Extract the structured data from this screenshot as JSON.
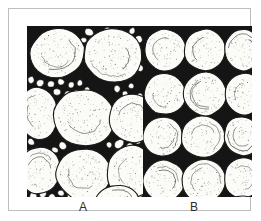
{
  "figure": {
    "frame_color": "#bdbdbd",
    "background_color": "#ffffff",
    "matrix_color": "#151515",
    "grain_fill_color": "#fbfbf7",
    "grain_outline_color": "#1a1a1a",
    "stipple_color": "#3c3c3c"
  },
  "panels": [
    {
      "id": "a",
      "label": "A",
      "sorting": "poorly sorted",
      "grain_count_large": 9,
      "grain_count_fine": 46,
      "pore_filling": "fine matrix grains",
      "large_grains": [
        {
          "cx": 30,
          "cy": 27,
          "rx": 27,
          "ry": 25,
          "rot": -12
        },
        {
          "cx": 86,
          "cy": 30,
          "rx": 30,
          "ry": 27,
          "rot": 8
        },
        {
          "cx": 11,
          "cy": 88,
          "rx": 20,
          "ry": 27,
          "rot": -6
        },
        {
          "cx": 57,
          "cy": 92,
          "rx": 31,
          "ry": 29,
          "rot": 14
        },
        {
          "cx": 106,
          "cy": 92,
          "rx": 24,
          "ry": 25,
          "rot": -9
        },
        {
          "cx": 12,
          "cy": 144,
          "rx": 21,
          "ry": 24,
          "rot": 10
        },
        {
          "cx": 57,
          "cy": 148,
          "rx": 28,
          "ry": 26,
          "rot": -5
        },
        {
          "cx": 104,
          "cy": 146,
          "rx": 24,
          "ry": 27,
          "rot": 6
        },
        {
          "cx": 90,
          "cy": 175,
          "rx": 22,
          "ry": 16,
          "rot": -3
        }
      ],
      "fine_grains": [
        {
          "cx": 62,
          "cy": 6,
          "rx": 4.5,
          "ry": 4.0
        },
        {
          "cx": 72,
          "cy": 9,
          "rx": 3.6,
          "ry": 3.2
        },
        {
          "cx": 80,
          "cy": 4,
          "rx": 3.2,
          "ry": 2.8
        },
        {
          "cx": 105,
          "cy": 5,
          "rx": 3.4,
          "ry": 3.0
        },
        {
          "cx": 112,
          "cy": 13,
          "rx": 3.8,
          "ry": 3.4
        },
        {
          "cx": 57,
          "cy": 14,
          "rx": 3.0,
          "ry": 2.6
        },
        {
          "cx": 109,
          "cy": 30,
          "rx": 3.4,
          "ry": 3.6
        },
        {
          "cx": 113,
          "cy": 42,
          "rx": 3.6,
          "ry": 3.4
        },
        {
          "cx": 4,
          "cy": 54,
          "rx": 3.6,
          "ry": 3.4
        },
        {
          "cx": 13,
          "cy": 57,
          "rx": 4.0,
          "ry": 3.6
        },
        {
          "cx": 24,
          "cy": 58,
          "rx": 3.8,
          "ry": 3.4
        },
        {
          "cx": 34,
          "cy": 56,
          "rx": 3.6,
          "ry": 3.2
        },
        {
          "cx": 44,
          "cy": 59,
          "rx": 3.4,
          "ry": 3.0
        },
        {
          "cx": 53,
          "cy": 57,
          "rx": 3.2,
          "ry": 3.0
        },
        {
          "cx": 30,
          "cy": 66,
          "rx": 4.0,
          "ry": 3.6
        },
        {
          "cx": 41,
          "cy": 68,
          "rx": 3.6,
          "ry": 3.2
        },
        {
          "cx": 50,
          "cy": 67,
          "rx": 3.4,
          "ry": 3.0
        },
        {
          "cx": 60,
          "cy": 64,
          "rx": 3.2,
          "ry": 2.8
        },
        {
          "cx": 6,
          "cy": 66,
          "rx": 3.4,
          "ry": 3.2
        },
        {
          "cx": 16,
          "cy": 68,
          "rx": 3.6,
          "ry": 3.2
        },
        {
          "cx": 35,
          "cy": 77,
          "rx": 3.8,
          "ry": 3.4
        },
        {
          "cx": 45,
          "cy": 78,
          "rx": 3.4,
          "ry": 3.0
        },
        {
          "cx": 90,
          "cy": 63,
          "rx": 3.6,
          "ry": 3.2
        },
        {
          "cx": 98,
          "cy": 68,
          "rx": 3.2,
          "ry": 3.0
        },
        {
          "cx": 104,
          "cy": 60,
          "rx": 3.0,
          "ry": 2.8
        },
        {
          "cx": 92,
          "cy": 118,
          "rx": 5.0,
          "ry": 4.4
        },
        {
          "cx": 103,
          "cy": 120,
          "rx": 3.8,
          "ry": 3.4
        },
        {
          "cx": 111,
          "cy": 115,
          "rx": 3.4,
          "ry": 3.0
        },
        {
          "cx": 36,
          "cy": 120,
          "rx": 4.4,
          "ry": 3.8
        },
        {
          "cx": 28,
          "cy": 124,
          "rx": 3.4,
          "ry": 3.0
        },
        {
          "cx": 4,
          "cy": 116,
          "rx": 3.6,
          "ry": 3.2
        },
        {
          "cx": 6,
          "cy": 170,
          "rx": 4.2,
          "ry": 3.6
        },
        {
          "cx": 16,
          "cy": 168,
          "rx": 3.8,
          "ry": 3.4
        },
        {
          "cx": 25,
          "cy": 171,
          "rx": 3.6,
          "ry": 3.2
        },
        {
          "cx": 34,
          "cy": 167,
          "rx": 3.4,
          "ry": 3.0
        },
        {
          "cx": 43,
          "cy": 170,
          "rx": 3.2,
          "ry": 2.8
        },
        {
          "cx": 11,
          "cy": 160,
          "rx": 3.4,
          "ry": 3.0
        },
        {
          "cx": 21,
          "cy": 159,
          "rx": 3.2,
          "ry": 2.8
        },
        {
          "cx": 66,
          "cy": 169,
          "rx": 4.0,
          "ry": 3.4
        },
        {
          "cx": 75,
          "cy": 166,
          "rx": 3.4,
          "ry": 3.0
        },
        {
          "cx": 82,
          "cy": 119,
          "rx": 3.0,
          "ry": 2.8
        },
        {
          "cx": 113,
          "cy": 70,
          "rx": 3.0,
          "ry": 2.8
        },
        {
          "cx": 2,
          "cy": 126,
          "rx": 3.0,
          "ry": 2.6
        },
        {
          "cx": 113,
          "cy": 168,
          "rx": 3.2,
          "ry": 2.8
        },
        {
          "cx": 54,
          "cy": 174,
          "rx": 3.0,
          "ry": 2.6
        },
        {
          "cx": 96,
          "cy": 10,
          "rx": 2.8,
          "ry": 2.6
        }
      ]
    },
    {
      "id": "b",
      "label": "B",
      "sorting": "well sorted",
      "grain_count_large": 13,
      "grain_count_fine": 0,
      "pore_filling": "open pore space",
      "rows": 4,
      "columns": 3,
      "large_grains": [
        {
          "cx": 22,
          "cy": 24,
          "rx": 21,
          "ry": 21,
          "rot": -6
        },
        {
          "cx": 62,
          "cy": 24,
          "rx": 21,
          "ry": 21,
          "rot": 5
        },
        {
          "cx": 100,
          "cy": 24,
          "rx": 19,
          "ry": 21,
          "rot": -4
        },
        {
          "cx": 22,
          "cy": 68,
          "rx": 21,
          "ry": 21,
          "rot": 7
        },
        {
          "cx": 62,
          "cy": 68,
          "rx": 22,
          "ry": 22,
          "rot": -8
        },
        {
          "cx": 101,
          "cy": 68,
          "rx": 19,
          "ry": 21,
          "rot": 4
        },
        {
          "cx": 20,
          "cy": 111,
          "rx": 20,
          "ry": 20,
          "rot": -5
        },
        {
          "cx": 60,
          "cy": 111,
          "rx": 22,
          "ry": 21,
          "rot": 6
        },
        {
          "cx": 99,
          "cy": 110,
          "rx": 18,
          "ry": 20,
          "rot": -10
        },
        {
          "cx": 21,
          "cy": 155,
          "rx": 21,
          "ry": 21,
          "rot": 4
        },
        {
          "cx": 61,
          "cy": 155,
          "rx": 22,
          "ry": 22,
          "rot": -6
        },
        {
          "cx": 100,
          "cy": 152,
          "rx": 19,
          "ry": 21,
          "rot": 12
        },
        {
          "cx": 98,
          "cy": 180,
          "rx": 17,
          "ry": 10,
          "rot": -4
        }
      ]
    }
  ]
}
